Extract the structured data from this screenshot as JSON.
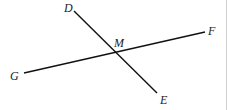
{
  "diagram": {
    "type": "intersecting-lines",
    "points": {
      "D": {
        "label": "D",
        "x": 74,
        "y": 11
      },
      "E": {
        "label": "E",
        "x": 157,
        "y": 93
      },
      "F": {
        "label": "F",
        "x": 205,
        "y": 32
      },
      "G": {
        "label": "G",
        "x": 24,
        "y": 73
      },
      "M": {
        "label": "M",
        "x": 115,
        "y": 52
      }
    },
    "segments": [
      {
        "name": "DE",
        "from": "D",
        "to": "E"
      },
      {
        "name": "GF",
        "from": "G",
        "to": "F"
      }
    ],
    "intersection": "M",
    "colors": {
      "line": "#111111",
      "label": "#222222",
      "border": "#cfcfcf"
    }
  }
}
